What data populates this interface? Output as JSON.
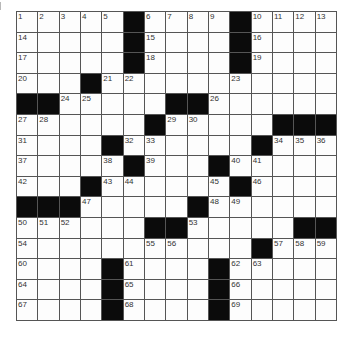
{
  "puzzle": {
    "rows": 15,
    "cols": 15,
    "colors": {
      "block": "#0b0b0b",
      "cell": "#fdfdfd",
      "line": "#555555",
      "number": "#333333"
    },
    "grid": [
      [
        "1",
        "2",
        "3",
        "4",
        "5",
        "#",
        "6",
        "7",
        "8",
        "9",
        "#",
        "10",
        "11",
        "12",
        "13"
      ],
      [
        "14",
        "",
        "",
        "",
        "",
        "#",
        "15",
        "",
        "",
        "",
        "#",
        "16",
        "",
        "",
        ""
      ],
      [
        "17",
        "",
        "",
        "",
        "",
        "#",
        "18",
        "",
        "",
        "",
        "#",
        "19",
        "",
        "",
        ""
      ],
      [
        "20",
        "",
        "",
        "#",
        "21",
        "22",
        "",
        "",
        "",
        "",
        "23",
        "",
        "",
        "",
        ""
      ],
      [
        "#",
        "#",
        "24",
        "25",
        "",
        "",
        "",
        "#",
        "#",
        "26",
        "",
        "",
        "",
        "",
        ""
      ],
      [
        "27",
        "28",
        "",
        "",
        "",
        "",
        "#",
        "29",
        "30",
        "",
        "",
        "",
        "#",
        "#",
        "#"
      ],
      [
        "31",
        "",
        "",
        "",
        "#",
        "32",
        "33",
        "",
        "",
        "",
        "",
        "#",
        "34",
        "35",
        "36"
      ],
      [
        "37",
        "",
        "",
        "",
        "38",
        "#",
        "39",
        "",
        "",
        "#",
        "40",
        "41",
        "",
        "",
        ""
      ],
      [
        "42",
        "",
        "",
        "#",
        "43",
        "44",
        "",
        "",
        "",
        "45",
        "#",
        "46",
        "",
        "",
        ""
      ],
      [
        "#",
        "#",
        "#",
        "47",
        "",
        "",
        "",
        "",
        "#",
        "48",
        "49",
        "",
        "",
        "",
        ""
      ],
      [
        "50",
        "51",
        "52",
        "",
        "",
        "",
        "#",
        "#",
        "53",
        "",
        "",
        "",
        "",
        "#",
        "#"
      ],
      [
        "54",
        "",
        "",
        "",
        "",
        "",
        "55",
        "56",
        "",
        "",
        "",
        "#",
        "57",
        "58",
        "59"
      ],
      [
        "60",
        "",
        "",
        "",
        "#",
        "61",
        "",
        "",
        "",
        "#",
        "62",
        "63",
        "",
        "",
        ""
      ],
      [
        "64",
        "",
        "",
        "",
        "#",
        "65",
        "",
        "",
        "",
        "#",
        "66",
        "",
        "",
        "",
        ""
      ],
      [
        "67",
        "",
        "",
        "",
        "#",
        "68",
        "",
        "",
        "",
        "#",
        "69",
        "",
        "",
        "",
        ""
      ]
    ]
  }
}
